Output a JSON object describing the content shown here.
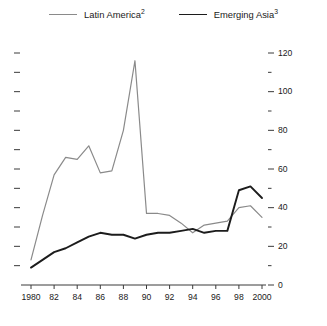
{
  "legend": {
    "entries": [
      {
        "label": "Latin America",
        "note": "2",
        "color": "#8a8a8a",
        "key": "latin-america"
      },
      {
        "label": "Emerging Asia",
        "note": "3",
        "color": "#1c1c1c",
        "key": "emerging-asia"
      }
    ]
  },
  "axes": {
    "y_right_ticks": [
      "120",
      "100",
      "80",
      "60",
      "40",
      "20",
      "0"
    ],
    "y_right_minor_count": 6,
    "y_left_minor_count": 13,
    "x_ticks": [
      "1980",
      "82",
      "84",
      "86",
      "88",
      "90",
      "92",
      "94",
      "96",
      "98",
      "2000"
    ]
  },
  "chart_data": {
    "type": "line",
    "title": "",
    "subtitle": "",
    "xlabel": "",
    "ylabel": "",
    "xlim": [
      1980,
      2000
    ],
    "ylim": [
      0,
      120
    ],
    "ytick_step": 20,
    "yminor_step": 10,
    "xtick_step": 2,
    "grid": false,
    "legend_position": "top-center",
    "x": [
      1980,
      1981,
      1982,
      1983,
      1984,
      1985,
      1986,
      1987,
      1988,
      1989,
      1990,
      1991,
      1992,
      1993,
      1994,
      1995,
      1996,
      1997,
      1998,
      1999,
      2000
    ],
    "series": [
      {
        "name": "Latin America",
        "note": "2",
        "color": "#8a8a8a",
        "width": 1.2,
        "values": [
          13,
          36,
          57,
          66,
          65,
          72,
          58,
          59,
          80,
          116,
          37,
          37,
          36,
          32,
          27,
          31,
          32,
          33,
          40,
          41,
          35
        ]
      },
      {
        "name": "Emerging Asia",
        "note": "3",
        "color": "#1c1c1c",
        "width": 1.9,
        "values": [
          9,
          13,
          17,
          19,
          22,
          25,
          27,
          26,
          26,
          24,
          26,
          27,
          27,
          28,
          29,
          27,
          28,
          28,
          49,
          51,
          45
        ]
      }
    ]
  },
  "geometry": {
    "plot_left": 31,
    "plot_right": 262,
    "y_zero": 285,
    "y_top": 53,
    "left_tick_x": 14,
    "left_tick_len": 6,
    "right_tick_x": 268,
    "right_tick_len": 6,
    "axis_color": "#3a3a3a"
  }
}
